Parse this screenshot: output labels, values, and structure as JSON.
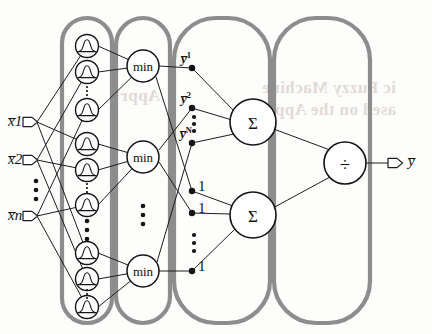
{
  "figure": {
    "colors": {
      "ink": "#141414",
      "container_stroke": "#8a8a8a",
      "bleed_text": "#d9cfcb",
      "background": "#fdfdfc"
    }
  },
  "bleedthrough": [
    {
      "text": "ic Fuzzy Machine",
      "x": 262,
      "y": 88,
      "size": 18
    },
    {
      "text": "ased on the Appro",
      "x": 258,
      "y": 110,
      "size": 18
    },
    {
      "text": "Appr",
      "x": 120,
      "y": 96,
      "size": 17
    }
  ],
  "inputs": [
    {
      "id": "x1",
      "base": "x",
      "sub": "1",
      "label": "x̅1",
      "x": 10,
      "y": 113
    },
    {
      "id": "x2",
      "base": "x",
      "sub": "2",
      "label": "x̅2",
      "x": 10,
      "y": 151
    },
    {
      "id": "xn",
      "base": "x",
      "sub": "n",
      "label": "x̅n",
      "x": 10,
      "y": 207
    }
  ],
  "input_ellipsis": {
    "symbol": "⋮",
    "x": 36,
    "y": 172
  },
  "output": {
    "id": "ybar",
    "label": "y̅",
    "x": 410,
    "y": 158
  },
  "layers": [
    {
      "id": "layer-membership",
      "name": "membership-layer",
      "container": {
        "x": 62,
        "y": 18,
        "w": 50,
        "h": 305
      },
      "node_shape": "circle-with-bell-curve",
      "node_label": "gaussian-membership-function",
      "count": 9,
      "groups": 3
    },
    {
      "id": "layer-min",
      "name": "rule-min-layer",
      "container": {
        "x": 116,
        "y": 18,
        "w": 54,
        "h": 305
      },
      "node_shape": "circle",
      "node_label": "min",
      "count": 3
    },
    {
      "id": "layer-consequent",
      "name": "consequent-sum-layer",
      "container": {
        "x": 174,
        "y": 18,
        "w": 96,
        "h": 305
      },
      "node_shape": "circle",
      "node_label": "Σ",
      "count": 2
    },
    {
      "id": "layer-divide",
      "name": "normalization-layer",
      "container": {
        "x": 274,
        "y": 18,
        "w": 96,
        "h": 305
      },
      "node_shape": "circle",
      "node_label": "÷",
      "count": 1
    }
  ],
  "membership_nodes": [
    {
      "id": "mf-1-1",
      "cx": 87,
      "cy": 46
    },
    {
      "id": "mf-1-2",
      "cx": 87,
      "cy": 72
    },
    {
      "id": "mf-1-3",
      "cx": 87,
      "cy": 110
    },
    {
      "id": "mf-2-1",
      "cx": 87,
      "cy": 144
    },
    {
      "id": "mf-2-2",
      "cx": 87,
      "cy": 170
    },
    {
      "id": "mf-2-3",
      "cx": 87,
      "cy": 205
    },
    {
      "id": "mf-3-1",
      "cx": 87,
      "cy": 253
    },
    {
      "id": "mf-3-2",
      "cx": 87,
      "cy": 279
    },
    {
      "id": "mf-3-3",
      "cx": 87,
      "cy": 307
    }
  ],
  "membership_ellipses": [
    {
      "symbol": "⋮",
      "x": 87,
      "y": 91,
      "small": true
    },
    {
      "symbol": "⋮",
      "x": 87,
      "y": 187,
      "small": true
    },
    {
      "symbol": "⋮",
      "x": 87,
      "y": 228,
      "small": false
    },
    {
      "symbol": "⋮",
      "x": 87,
      "y": 293,
      "small": true
    }
  ],
  "min_nodes": [
    {
      "id": "min-1",
      "cx": 143,
      "cy": 66,
      "label": "min"
    },
    {
      "id": "min-2",
      "cx": 143,
      "cy": 157,
      "label": "min"
    },
    {
      "id": "min-3",
      "cx": 143,
      "cy": 271,
      "label": "min"
    }
  ],
  "min_ellipsis": {
    "symbol": "⋮",
    "x": 143,
    "y": 215
  },
  "y_nodes": [
    {
      "id": "y-1",
      "label": "y̅",
      "sup": "1",
      "cx": 192,
      "cy": 68,
      "lx": 182,
      "ly": 58
    },
    {
      "id": "y-2",
      "label": "y̅",
      "sup": "2",
      "cx": 192,
      "cy": 108,
      "lx": 182,
      "ly": 98
    },
    {
      "id": "y-N",
      "label": "y̅",
      "sup": "N",
      "cx": 192,
      "cy": 143,
      "lx": 181,
      "ly": 133
    }
  ],
  "y_ellipsis": {
    "symbol": "⋮",
    "x": 193,
    "y": 123
  },
  "one_nodes": [
    {
      "id": "one-1",
      "label": "1",
      "cx": 192,
      "cy": 191,
      "lx": 198,
      "ly": 184
    },
    {
      "id": "one-2",
      "label": "1",
      "cx": 192,
      "cy": 213,
      "lx": 198,
      "ly": 206
    },
    {
      "id": "one-3",
      "label": "1",
      "cx": 192,
      "cy": 271,
      "lx": 198,
      "ly": 264
    }
  ],
  "one_ellipsis": {
    "symbol": "⋮",
    "x": 193,
    "y": 242
  },
  "sum_nodes": [
    {
      "id": "sum-numerator",
      "label": "Σ",
      "cx": 253,
      "cy": 122
    },
    {
      "id": "sum-denominator",
      "label": "Σ",
      "cx": 253,
      "cy": 215
    }
  ],
  "divide_node": {
    "id": "divide",
    "label": "÷",
    "cx": 345,
    "cy": 163
  },
  "edges": {
    "input_to_membership": [
      [
        "x1",
        "mf-1-1"
      ],
      [
        "x1",
        "mf-2-1"
      ],
      [
        "x1",
        "mf-3-1"
      ],
      [
        "x2",
        "mf-1-2"
      ],
      [
        "x2",
        "mf-2-2"
      ],
      [
        "x2",
        "mf-3-2"
      ],
      [
        "xn",
        "mf-1-3"
      ],
      [
        "xn",
        "mf-2-3"
      ],
      [
        "xn",
        "mf-3-3"
      ]
    ],
    "membership_to_min": [
      [
        "mf-1-1",
        "min-1"
      ],
      [
        "mf-1-2",
        "min-1"
      ],
      [
        "mf-1-3",
        "min-1"
      ],
      [
        "mf-2-1",
        "min-2"
      ],
      [
        "mf-2-2",
        "min-2"
      ],
      [
        "mf-2-3",
        "min-2"
      ],
      [
        "mf-3-1",
        "min-3"
      ],
      [
        "mf-3-2",
        "min-3"
      ],
      [
        "mf-3-3",
        "min-3"
      ]
    ],
    "min_to_nodes": [
      [
        "min-1",
        "y-1"
      ],
      [
        "min-1",
        "one-1"
      ],
      [
        "min-2",
        "y-2"
      ],
      [
        "min-2",
        "one-2"
      ],
      [
        "min-3",
        "y-N"
      ],
      [
        "min-3",
        "one-3"
      ]
    ],
    "to_numerator": [
      [
        "y-1",
        "sum-numerator"
      ],
      [
        "y-2",
        "sum-numerator"
      ],
      [
        "y-N",
        "sum-numerator"
      ]
    ],
    "to_denominator": [
      [
        "one-1",
        "sum-denominator"
      ],
      [
        "one-2",
        "sum-denominator"
      ],
      [
        "one-3",
        "sum-denominator"
      ]
    ],
    "to_divide": [
      [
        "sum-numerator",
        "divide"
      ],
      [
        "sum-denominator",
        "divide"
      ]
    ],
    "to_output": [
      [
        "divide",
        "ybar"
      ]
    ]
  }
}
